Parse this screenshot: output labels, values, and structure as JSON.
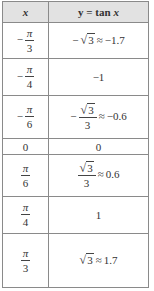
{
  "table": {
    "headers": {
      "x": "x",
      "y_prefix": "y = tan ",
      "y_var": "x"
    },
    "rows": [
      {
        "x": {
          "sign": "−",
          "num": "π",
          "den": "3"
        },
        "y": {
          "sign": "−",
          "sqrt": "3",
          "approx": "≈",
          "value": "−1.7"
        }
      },
      {
        "x": {
          "sign": "−",
          "num": "π",
          "den": "4"
        },
        "y": {
          "value": "−1"
        }
      },
      {
        "x": {
          "sign": "−",
          "num": "π",
          "den": "6"
        },
        "y": {
          "sign": "−",
          "sqrt": "3",
          "den": "3",
          "approx": "≈",
          "value": "−0.6"
        }
      },
      {
        "x": {
          "value": "0"
        },
        "y": {
          "value": "0"
        }
      },
      {
        "x": {
          "num": "π",
          "den": "6"
        },
        "y": {
          "sqrt": "3",
          "den": "3",
          "approx": "≈",
          "value": "0.6"
        }
      },
      {
        "x": {
          "num": "π",
          "den": "4"
        },
        "y": {
          "value": "1"
        }
      },
      {
        "x": {
          "num": "π",
          "den": "3"
        },
        "y": {
          "sqrt": "3",
          "approx": "≈",
          "value": "1.7"
        }
      }
    ]
  },
  "colors": {
    "header_bg": "#e2e2e2",
    "border": "#8a8a8a",
    "text": "#333333"
  },
  "symbols": {
    "radical": "√"
  }
}
